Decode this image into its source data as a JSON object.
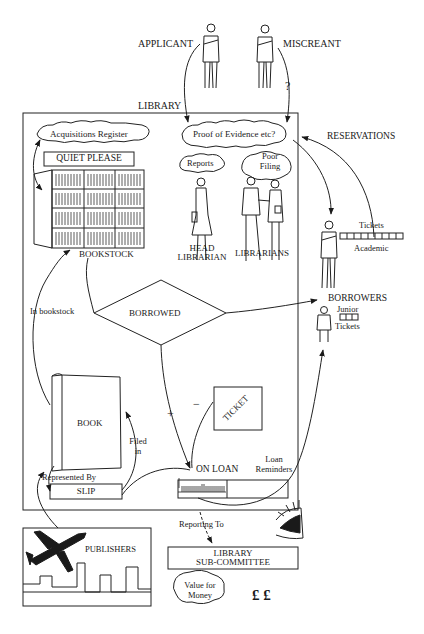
{
  "diagram": {
    "actors": {
      "applicant": "APPLICANT",
      "miscreant": "MISCREANT",
      "question_mark": "?"
    },
    "library_label": "LIBRARY",
    "clouds": {
      "acquisitions": "Acquisitions Register",
      "proof": "Proof of Evidence etc?",
      "reports": "Reports",
      "poor_filing_1": "Poor",
      "poor_filing_2": "Filing",
      "value_1": "Value for",
      "value_2": "Money"
    },
    "quiet_sign": "QUIET PLEASE",
    "reservations": "RESERVATIONS",
    "bookstock": "BOOKSTOCK",
    "head_librarian_1": "HEAD",
    "head_librarian_2": "LIBRARIAN",
    "librarians": "LIBRARIANS",
    "borrowers": {
      "academic_tickets": "Tickets",
      "academic": "Academic",
      "title": "BORROWERS",
      "junior": "Junior",
      "junior_tickets": "Tickets"
    },
    "decision": "BORROWED",
    "in_bookstock": "In bookstock",
    "book": "BOOK",
    "plus": "+",
    "minus": "−",
    "ticket": "TICKET",
    "filed_in_1": "Filed",
    "filed_in_2": "in",
    "represented_by": "Represented By",
    "slip": "SLIP",
    "on_loan": "ON LOAN",
    "loan_reminders_1": "Loan",
    "loan_reminders_2": "Reminders",
    "reporting_to": "Reporting To",
    "publishers": "PUBLISHERS",
    "subcommittee_1": "LIBRARY",
    "subcommittee_2": "SUB-COMMITTEE",
    "money": "£ £",
    "colors": {
      "ink": "#1a1a1a",
      "paper": "#ffffff"
    }
  }
}
